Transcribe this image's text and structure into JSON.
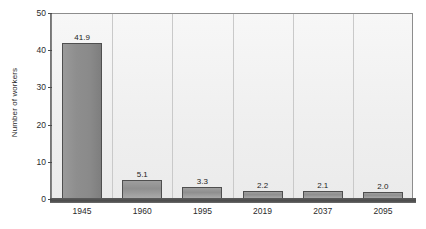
{
  "chart_data": {
    "type": "bar",
    "title": "",
    "subtitle": "",
    "xlabel": "",
    "ylabel": "Number of workers",
    "categories": [
      "1945",
      "1960",
      "1995",
      "2019",
      "2037",
      "2095"
    ],
    "values": [
      41.9,
      5.1,
      3.3,
      2.2,
      2.1,
      2.0
    ],
    "value_labels": [
      "41.9",
      "5.1",
      "3.3",
      "2.2",
      "2.1",
      "2.0"
    ],
    "ylim": [
      0,
      50
    ],
    "yticks": [
      0,
      10,
      20,
      30,
      40,
      50
    ],
    "ytick_labels": [
      "0",
      "10",
      "20",
      "30",
      "40",
      "50"
    ],
    "grid": false,
    "legend": null,
    "legend_position": "none",
    "series": [
      {
        "name": "Number of workers",
        "values": [
          41.9,
          5.1,
          3.3,
          2.2,
          2.1,
          2.0
        ]
      }
    ]
  },
  "colors": {
    "bar_fill": "#8a8a8a",
    "bar_border": "#4f4f4f",
    "plot_background": "#efefef",
    "axis_line": "#4a4a4a",
    "text": "#2b2b2b",
    "page_background": "#ffffff",
    "separator": "#c9c9c9"
  }
}
